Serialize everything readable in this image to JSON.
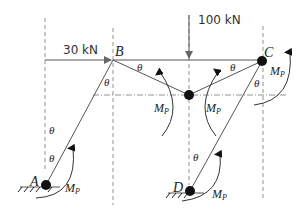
{
  "diagram": {
    "type": "frame mechanism (plastic collapse)",
    "nodes": {
      "A": {
        "label": "A",
        "x": 46,
        "y": 185,
        "support": "fixed"
      },
      "B": {
        "label": "B",
        "x": 113,
        "y": 60
      },
      "C": {
        "label": "C",
        "x": 262,
        "y": 61,
        "hinge": true
      },
      "D": {
        "label": "D",
        "x": 190,
        "y": 191,
        "support": "fixed"
      },
      "H": {
        "label": "",
        "x": 189,
        "y": 95,
        "hinge": true
      }
    },
    "loads": {
      "horizontal": {
        "label": "30 kN",
        "at": "B",
        "direction": "right"
      },
      "vertical": {
        "label": "100 kN",
        "at": "beam midspan",
        "direction": "down"
      }
    },
    "angle_symbol": "θ",
    "moment_label_main": "M",
    "moment_label_sub": "P",
    "colors": {
      "line": "#555555",
      "guide": "#777777",
      "hinge": "#111111",
      "text": "#222222"
    }
  }
}
